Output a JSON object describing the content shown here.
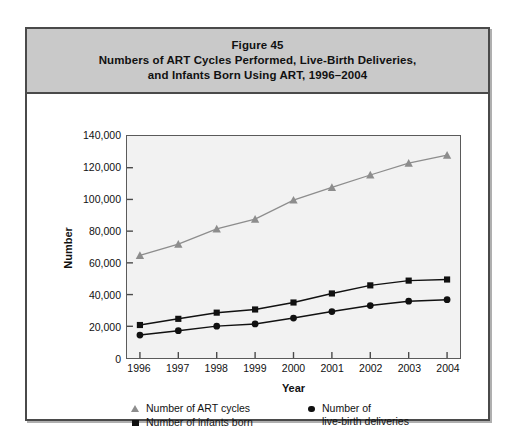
{
  "figure": {
    "title_lines": [
      "Figure 45",
      "Numbers of ART Cycles Performed, Live-Birth Deliveries,",
      "and Infants Born Using ART, 1996–2004"
    ]
  },
  "legend": {
    "entries": [
      {
        "symbol": "triangle",
        "label": "Number of ART cycles"
      },
      {
        "symbol": "square",
        "label": "Number of infants born"
      },
      {
        "symbol": "circle",
        "label_line1": "Number of",
        "label_line2": "live-birth deliveries"
      }
    ]
  },
  "chart_data": {
    "type": "line",
    "title": "Numbers of ART Cycles Performed, Live-Birth Deliveries, and Infants Born Using ART, 1996–2004",
    "xlabel": "Year",
    "ylabel": "Number",
    "categories": [
      "1996",
      "1997",
      "1998",
      "1999",
      "2000",
      "2001",
      "2002",
      "2003",
      "2004"
    ],
    "x": [
      1996,
      1997,
      1998,
      1999,
      2000,
      2001,
      2002,
      2003,
      2004
    ],
    "ylim": [
      0,
      140000
    ],
    "xlim": [
      1996,
      2004
    ],
    "ytick_labels": [
      "0",
      "20,000",
      "40,000",
      "60,000",
      "80,000",
      "100,000",
      "120,000",
      "140,000"
    ],
    "yticks": [
      0,
      20000,
      40000,
      60000,
      80000,
      100000,
      120000,
      140000
    ],
    "grid": false,
    "legend_position": "bottom",
    "series": [
      {
        "name": "Number of ART cycles",
        "marker": "triangle",
        "color": "#8d8d8d",
        "values": [
          64700,
          71800,
          81400,
          87600,
          99600,
          107600,
          115400,
          122900,
          127900
        ]
      },
      {
        "name": "Number of infants born",
        "marker": "square",
        "color": "#111111",
        "values": [
          20800,
          24700,
          28600,
          30600,
          35000,
          40700,
          45800,
          48800,
          49500
        ]
      },
      {
        "name": "Number of live-birth deliveries",
        "marker": "circle",
        "color": "#111111",
        "values": [
          14500,
          17200,
          20100,
          21500,
          25200,
          29300,
          33100,
          35800,
          36800
        ]
      }
    ]
  }
}
